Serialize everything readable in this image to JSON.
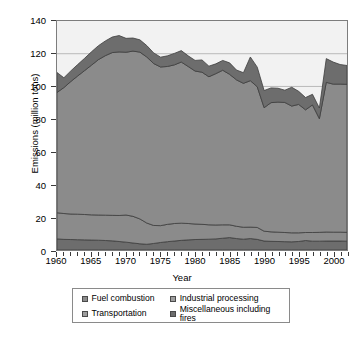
{
  "chart_data": {
    "type": "area",
    "title": "",
    "xlabel": "Year",
    "ylabel": "Emissions (million tons)",
    "xlim": [
      1960,
      2002
    ],
    "ylim": [
      0,
      140
    ],
    "xticks": [
      1960,
      1965,
      1970,
      1975,
      1980,
      1985,
      1990,
      1995,
      2000
    ],
    "yticks": [
      0,
      20,
      40,
      60,
      80,
      100,
      120,
      140
    ],
    "grid": "horizontal-sparse",
    "legend_position": "below",
    "stacked": true,
    "x": [
      1960,
      1961,
      1962,
      1963,
      1964,
      1965,
      1966,
      1967,
      1968,
      1969,
      1970,
      1971,
      1972,
      1973,
      1974,
      1975,
      1976,
      1977,
      1978,
      1979,
      1980,
      1981,
      1982,
      1983,
      1984,
      1985,
      1986,
      1987,
      1988,
      1989,
      1990,
      1991,
      1992,
      1993,
      1994,
      1995,
      1996,
      1997,
      1998,
      1999,
      2000,
      2001,
      2002
    ],
    "series": [
      {
        "name": "Miscellaneous including fires",
        "color": "#6d6d6d",
        "values": [
          6.8,
          6.5,
          6.4,
          6.3,
          6.2,
          6.1,
          6.0,
          5.8,
          5.6,
          5.2,
          4.8,
          4.3,
          3.8,
          3.5,
          4.0,
          4.6,
          5.1,
          5.5,
          5.9,
          6.2,
          6.4,
          6.5,
          6.6,
          6.8,
          7.2,
          7.6,
          7.0,
          6.6,
          7.0,
          6.5,
          5.5,
          5.3,
          5.2,
          5.1,
          5.0,
          5.2,
          5.8,
          5.4,
          5.4,
          5.5,
          5.5,
          5.5,
          5.4
        ]
      },
      {
        "name": "Transportation",
        "color": "#8b8b8b",
        "values": [
          16.0,
          15.8,
          15.6,
          15.6,
          15.5,
          15.4,
          15.4,
          15.5,
          15.6,
          15.9,
          16.6,
          16.3,
          15.2,
          13.0,
          11.0,
          10.3,
          10.6,
          10.7,
          10.5,
          10.0,
          9.5,
          9.2,
          8.8,
          8.5,
          8.2,
          7.8,
          7.5,
          7.3,
          7.0,
          7.3,
          6.0,
          5.8,
          5.7,
          5.6,
          5.5,
          5.3,
          4.9,
          5.3,
          5.4,
          5.5,
          5.4,
          5.4,
          5.4
        ]
      },
      {
        "name": "Industrial processing",
        "color": "#8b8b8b",
        "values": [
          73.5,
          77.0,
          81.0,
          84.5,
          88.0,
          91.5,
          95.0,
          97.5,
          99.5,
          100.0,
          99.5,
          101.0,
          102.0,
          101.5,
          99.0,
          97.0,
          96.5,
          97.0,
          98.5,
          96.0,
          93.5,
          93.0,
          90.5,
          92.5,
          94.5,
          92.0,
          89.5,
          88.0,
          89.5,
          86.0,
          75.5,
          79.0,
          79.5,
          79.5,
          77.5,
          78.5,
          75.0,
          78.0,
          69.5,
          91.5,
          90.5,
          90.5,
          90.5
        ]
      },
      {
        "name": "Fuel combustion",
        "color": "#6d6d6d",
        "values": [
          12.2,
          6.0,
          6.5,
          7.0,
          7.5,
          8.2,
          8.5,
          9.0,
          9.5,
          10.0,
          8.5,
          8.0,
          7.5,
          7.0,
          6.5,
          6.0,
          6.5,
          7.0,
          7.0,
          6.5,
          6.5,
          7.5,
          6.5,
          6.0,
          6.0,
          7.0,
          6.0,
          6.5,
          14.5,
          12.0,
          10.5,
          9.0,
          8.5,
          7.5,
          11.5,
          8.0,
          7.5,
          6.5,
          6.5,
          14.5,
          13.5,
          12.0,
          11.5
        ]
      }
    ],
    "totals_note": "Stacked total peaks near 130 around 1970 and dips to about 81 in 1998"
  },
  "legend": {
    "items": [
      {
        "label": "Fuel combustion",
        "color": "#8b8b8b"
      },
      {
        "label": "Industrial processing",
        "color": "#9e9e9e"
      },
      {
        "label": "Transportation",
        "color": "#9e9e9e"
      },
      {
        "label": "Miscellaneous including fires",
        "color": "#6d6d6d"
      }
    ]
  },
  "axes": {
    "y_title": "Emissions (million tons)",
    "x_title": "Year",
    "y_tick_labels": [
      "140",
      "120",
      "100",
      "80",
      "60",
      "40",
      "20",
      "0"
    ],
    "x_tick_labels": [
      "1960",
      "1965",
      "1970",
      "1975",
      "1980",
      "1985",
      "1990",
      "1995",
      "2000"
    ]
  }
}
